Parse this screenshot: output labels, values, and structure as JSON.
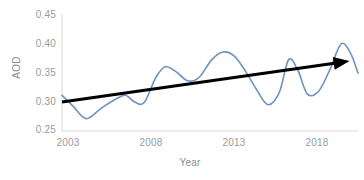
{
  "chart_data": {
    "type": "line",
    "title": "",
    "xlabel": "Year",
    "ylabel": "AOD",
    "xlim": [
      2003,
      2018.8
    ],
    "ylim": [
      0.25,
      0.45
    ],
    "grid": false,
    "legend": "none",
    "xticks": [
      "2003",
      "2008",
      "2013",
      "2018"
    ],
    "xtick_values": [
      2003,
      2008,
      2013,
      2018
    ],
    "yticks": [
      "0.25",
      "0.30",
      "0.35",
      "0.40",
      "0.45"
    ],
    "ytick_values": [
      0.25,
      0.3,
      0.35,
      0.4,
      0.45
    ],
    "series": [
      {
        "name": "AOD",
        "color": "#6e93c0",
        "style": "smooth-line",
        "x": [
          2003.0,
          2003.6,
          2004.3,
          2005.1,
          2005.9,
          2006.4,
          2006.9,
          2007.4,
          2008.0,
          2008.5,
          2009.1,
          2009.7,
          2010.3,
          2011.0,
          2011.6,
          2012.2,
          2012.8,
          2013.4,
          2014.0,
          2014.6,
          2015.1,
          2015.6,
          2016.1,
          2016.7,
          2017.3,
          2017.9,
          2018.4,
          2018.8
        ],
        "y": [
          0.311,
          0.292,
          0.271,
          0.289,
          0.305,
          0.311,
          0.299,
          0.299,
          0.341,
          0.36,
          0.351,
          0.336,
          0.341,
          0.372,
          0.385,
          0.378,
          0.352,
          0.32,
          0.295,
          0.316,
          0.372,
          0.353,
          0.313,
          0.318,
          0.355,
          0.399,
          0.383,
          0.349
        ]
      },
      {
        "name": "Linear trend",
        "color": "#000000",
        "style": "arrow",
        "x": [
          2003.0,
          2018.35
        ],
        "y": [
          0.2995,
          0.3695
        ]
      }
    ],
    "annotations": [
      {
        "type": "arrowhead",
        "at_x": 2018.35,
        "at_y": 0.3695,
        "color": "#000000"
      }
    ]
  },
  "axes": {
    "y_axis_line_color": "#d9d9d9",
    "x_axis_line_color": "#d9d9d9",
    "tick_text_color": "#9b9b9b"
  }
}
